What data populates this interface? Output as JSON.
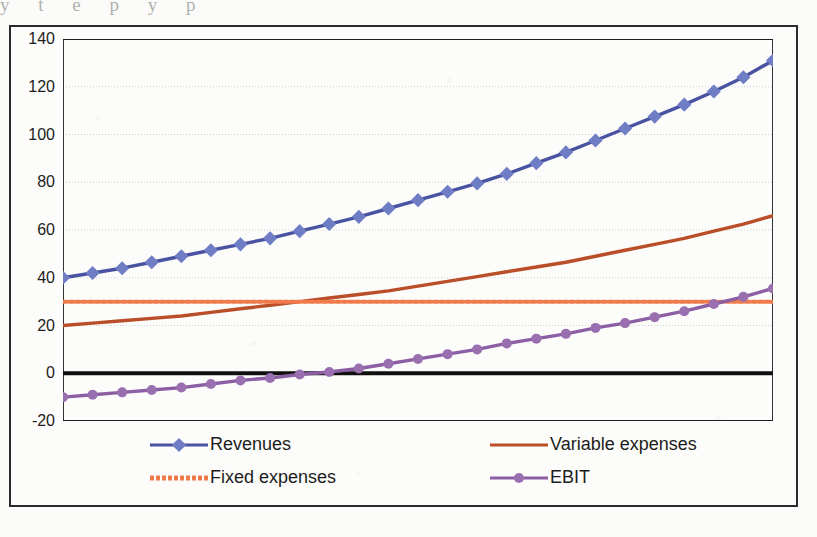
{
  "page": {
    "bleed_text_above": "y    t    e    p    y    p"
  },
  "chart_data": {
    "type": "line",
    "title": "",
    "xlabel": "",
    "ylabel": "",
    "ylim": [
      -20,
      140
    ],
    "xlim": [
      0,
      24
    ],
    "ytick_labels": [
      "140",
      "120",
      "100",
      "80",
      "60",
      "40",
      "20",
      "0",
      "-20"
    ],
    "ytick_values": [
      140,
      120,
      100,
      80,
      60,
      40,
      20,
      0,
      -20
    ],
    "xtick_labels": [],
    "grid": "horizontal",
    "legend_position": "bottom",
    "zero_line": true,
    "x": [
      0,
      1,
      2,
      3,
      4,
      5,
      6,
      7,
      8,
      9,
      10,
      11,
      12,
      13,
      14,
      15,
      16,
      17,
      18,
      19,
      20,
      21,
      22,
      23,
      24
    ],
    "series": [
      {
        "name": "Revenues",
        "color": "#4a53a2",
        "marker": "diamond",
        "marker_color": "#6f7dc4",
        "line_style": "solid",
        "values": [
          40,
          42,
          44,
          46.5,
          49,
          51.5,
          54,
          56.5,
          59.5,
          62.5,
          65.5,
          69,
          72.5,
          76,
          79.5,
          83.5,
          88,
          92.5,
          97.5,
          102.5,
          107.5,
          112.5,
          118,
          124,
          131
        ]
      },
      {
        "name": "Variable expenses",
        "color": "#b94e28",
        "marker": "none",
        "line_style": "solid",
        "values": [
          20,
          21,
          22,
          23,
          24,
          25.5,
          27,
          28.5,
          30,
          31.5,
          33,
          34.5,
          36.5,
          38.5,
          40.5,
          42.5,
          44.5,
          46.5,
          49,
          51.5,
          54,
          56.5,
          59.5,
          62.5,
          66
        ]
      },
      {
        "name": "Fixed expenses",
        "color": "#f07a4a",
        "marker": "none",
        "line_style": "dotted",
        "values": [
          30,
          30,
          30,
          30,
          30,
          30,
          30,
          30,
          30,
          30,
          30,
          30,
          30,
          30,
          30,
          30,
          30,
          30,
          30,
          30,
          30,
          30,
          30,
          30,
          30
        ]
      },
      {
        "name": "EBIT",
        "color": "#8c5fa5",
        "marker": "circle",
        "marker_color": "#9a6fb0",
        "line_style": "solid",
        "values": [
          -10,
          -9,
          -8,
          -7,
          -6,
          -4.5,
          -3,
          -2,
          -0.5,
          0.5,
          2,
          4,
          6,
          8,
          10,
          12.5,
          14.5,
          16.5,
          19,
          21,
          23.5,
          26,
          29,
          32,
          35.5
        ]
      }
    ]
  },
  "legend": {
    "items": [
      {
        "label": "Revenues",
        "color": "#4a53a2",
        "marker": "diamond",
        "marker_color": "#6f7dc4",
        "style": "solid"
      },
      {
        "label": "Variable expenses",
        "color": "#b94e28",
        "marker": "none",
        "marker_color": "#b94e28",
        "style": "solid"
      },
      {
        "label": "Fixed expenses",
        "color": "#f07a4a",
        "marker": "none",
        "marker_color": "#f07a4a",
        "style": "dotted"
      },
      {
        "label": "EBIT",
        "color": "#8c5fa5",
        "marker": "circle",
        "marker_color": "#9a6fb0",
        "style": "solid"
      }
    ]
  },
  "colors": {
    "revenues": "#4a53a2",
    "variable_expenses": "#b94e28",
    "fixed_expenses": "#f07a4a",
    "ebit": "#8c5fa5",
    "axis": "#1d1d1d",
    "grid": "#c9c9c9",
    "background": "#fcfcfa"
  }
}
